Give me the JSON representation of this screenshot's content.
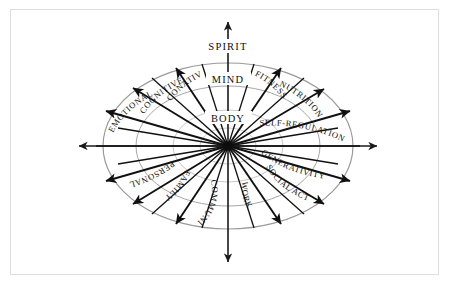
{
  "diagram": {
    "center_labels": [
      {
        "name": "spirit",
        "text": "SPIRIT"
      },
      {
        "name": "mind",
        "text": "MIND"
      },
      {
        "name": "body",
        "text": "BODY"
      }
    ],
    "axes": [
      {
        "name": "vertical-axis",
        "orientation": "vertical",
        "arrowheads": "both"
      },
      {
        "name": "horizontal-axis",
        "orientation": "horizontal",
        "arrowheads": "both"
      }
    ],
    "rings": {
      "count": 4,
      "note": "concentric gray ellipses"
    },
    "colors": {
      "background": "#ffffff",
      "frame": "#dedede",
      "ring": "#a6a6a6",
      "ring_faint": "#c2c2c2",
      "arrow": "#111111",
      "text": "#121212"
    },
    "spokes": [
      {
        "name": "emotional",
        "label": "EMOTIONAL",
        "angle_deg": 196
      },
      {
        "name": "cognitive",
        "label": "COGNITIVE",
        "angle_deg": 214
      },
      {
        "name": "conative",
        "label": "CONATIVE",
        "angle_deg": 239
      },
      {
        "name": "fitness",
        "label": "FITNESS",
        "angle_deg": 302
      },
      {
        "name": "nutrition",
        "label": "NUTRITION",
        "angle_deg": 326
      },
      {
        "name": "self-regulation",
        "label": "SELF-REGULATION",
        "angle_deg": 344
      },
      {
        "name": "generativity",
        "label": "GENERATIVITY",
        "angle_deg": 16
      },
      {
        "name": "social-activism",
        "label": "SOCIAL ACTIVISM",
        "angle_deg": 36
      },
      {
        "name": "work",
        "label": "WORK",
        "angle_deg": 62
      },
      {
        "name": "community",
        "label": "COMMUNITY",
        "angle_deg": 118
      },
      {
        "name": "family",
        "label": "FAMILY",
        "angle_deg": 144
      },
      {
        "name": "personal",
        "label": "PERSONAL",
        "angle_deg": 164
      }
    ]
  }
}
